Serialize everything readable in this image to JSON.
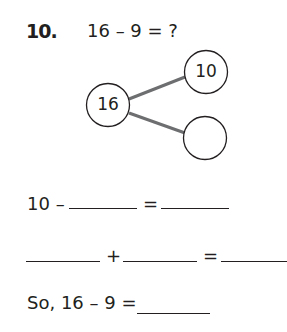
{
  "problem": {
    "number": "10.",
    "question": "16 – 9 = ?"
  },
  "number_bond": {
    "whole": "16",
    "parts": [
      "10",
      ""
    ],
    "line_color": "#6d6e70"
  },
  "steps": {
    "line1": {
      "start": "10 –",
      "op": "="
    },
    "line2": {
      "op1": "+",
      "op2": "="
    },
    "line3": {
      "start": "So, 16 – 9 ="
    }
  }
}
